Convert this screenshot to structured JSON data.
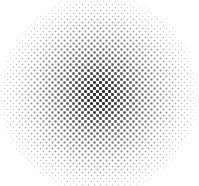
{
  "graphic": {
    "type": "halftone-radial-gradient",
    "width": 199,
    "height": 186,
    "center": {
      "x": 99,
      "y": 95
    },
    "radius": 100,
    "dot_color": "#1a1a1a",
    "background_color": "#ffffff",
    "grid_pitch": 6,
    "grid_rotation_deg": 45
  }
}
